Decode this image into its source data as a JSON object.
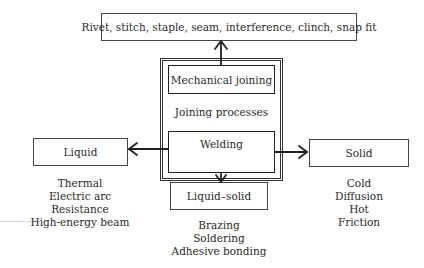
{
  "diagram": {
    "top_box": {
      "label": "Rivet, stitch, staple, seam, interference, clinch, snap fit"
    },
    "center": {
      "mechanical_label": "Mechanical joining",
      "center_label": "Joining processes",
      "welding_label": "Welding"
    },
    "categories": [
      {
        "label": "Liquid",
        "items": [
          "Thermal",
          "Electric arc",
          "Resistance",
          "High-energy beam"
        ]
      },
      {
        "label": "Liquid–solid",
        "items": [
          "Brazing",
          "Soldering",
          "Adhesive bonding"
        ]
      },
      {
        "label": "Solid",
        "items": [
          "Cold",
          "Diffusion",
          "Hot",
          "Friction"
        ]
      }
    ],
    "colors": {
      "line": "#222222",
      "text": "#2a2a2a",
      "background": "#ffffff"
    }
  }
}
